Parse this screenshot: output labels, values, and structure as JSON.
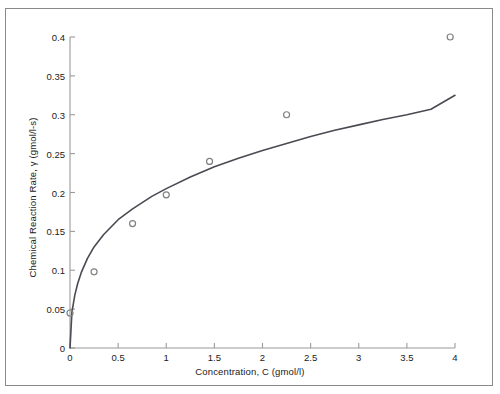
{
  "chart_data": {
    "type": "scatter",
    "title": "",
    "xlabel": "Concentration, C (gmol/l)",
    "ylabel": "Chemical Reaction Rate, γ (gmol/l-s)",
    "xlim": [
      0,
      4
    ],
    "ylim": [
      0,
      0.4
    ],
    "grid": false,
    "legend": "none",
    "xticks": [
      "0",
      "0.5",
      "1",
      "1.5",
      "2",
      "2.5",
      "3",
      "3.5",
      "4"
    ],
    "xtick_values": [
      0,
      0.5,
      1,
      1.5,
      2,
      2.5,
      3,
      3.5,
      4
    ],
    "yticks": [
      "0",
      "0.05",
      "0.1",
      "0.15",
      "0.2",
      "0.25",
      "0.3",
      "0.35",
      "0.4"
    ],
    "ytick_values": [
      0,
      0.05,
      0.1,
      0.15,
      0.2,
      0.25,
      0.3,
      0.35,
      0.4
    ],
    "series": [
      {
        "name": "measured data",
        "type": "scatter",
        "marker": "open-circle",
        "color": "#808080",
        "x": [
          0.0,
          0.25,
          0.65,
          1.0,
          1.45,
          2.25,
          3.95
        ],
        "y": [
          0.045,
          0.098,
          0.16,
          0.197,
          0.24,
          0.3,
          0.4
        ]
      },
      {
        "name": "fitted curve",
        "type": "line",
        "color": "#4a4a52",
        "x": [
          0.0,
          0.02,
          0.05,
          0.08,
          0.12,
          0.18,
          0.25,
          0.35,
          0.5,
          0.65,
          0.85,
          1.0,
          1.25,
          1.5,
          1.75,
          2.0,
          2.25,
          2.5,
          2.75,
          3.0,
          3.25,
          3.5,
          3.75,
          4.0
        ],
        "y": [
          0.0,
          0.046,
          0.068,
          0.083,
          0.098,
          0.115,
          0.13,
          0.146,
          0.165,
          0.179,
          0.195,
          0.205,
          0.22,
          0.233,
          0.244,
          0.254,
          0.263,
          0.272,
          0.28,
          0.287,
          0.294,
          0.3,
          0.307,
          0.325
        ]
      }
    ]
  }
}
